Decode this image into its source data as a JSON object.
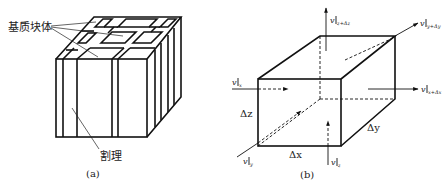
{
  "figure_a": {
    "caption": "(a)",
    "label_matrix_block": "基质块体",
    "label_cleat": "割理"
  },
  "figure_b": {
    "caption": "(b)",
    "dim_x": "Δx",
    "dim_y": "Δy",
    "dim_z": "Δz",
    "flow_in_x": {
      "v": "v",
      "sub": "x"
    },
    "flow_out_x": {
      "v": "v",
      "sub": "x+Δx"
    },
    "flow_in_y": {
      "v": "v",
      "sub": "y"
    },
    "flow_out_y": {
      "v": "v",
      "sub": "y+Δy"
    },
    "flow_in_z": {
      "v": "v",
      "sub": "z"
    },
    "flow_out_z": {
      "v": "v",
      "sub": "z+Δz"
    }
  },
  "colors": {
    "line": "#111111",
    "background": "#ffffff"
  }
}
